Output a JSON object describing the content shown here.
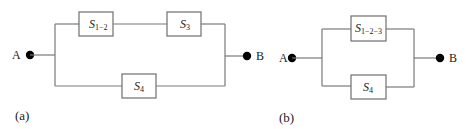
{
  "diagram_a": {
    "caption": "(a)",
    "terminal_left": "A",
    "terminal_right": "B",
    "blocks": [
      {
        "symbol": "S",
        "subscript": "1−2"
      },
      {
        "symbol": "S",
        "subscript": "3"
      },
      {
        "symbol": "S",
        "subscript": "4"
      }
    ]
  },
  "diagram_b": {
    "caption": "(b)",
    "terminal_left": "A",
    "terminal_right": "B",
    "blocks": [
      {
        "symbol": "S",
        "subscript": "1−2−3"
      },
      {
        "symbol": "S",
        "subscript": "4"
      }
    ]
  },
  "colors": {
    "wire": "#7a7a7a",
    "node": "#000000",
    "text": "#222222"
  }
}
